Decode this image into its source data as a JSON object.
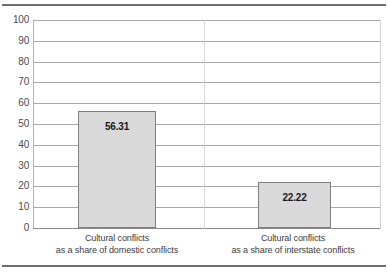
{
  "chart_data": {
    "type": "bar",
    "title": "",
    "subtitle": "",
    "xlabel": "",
    "ylabel": "",
    "ylim": [
      0,
      100
    ],
    "grid": true,
    "legend": "none",
    "orientation": "vertical",
    "categories": [
      "Cultural conflicts as a share of domestic conflicts",
      "Cultural conflicts as a share of interstate conflicts"
    ],
    "category_lines": [
      [
        "Cultural conflicts",
        "as a share of domestic conflicts"
      ],
      [
        "Cultural conflicts",
        "as a share of interstate conflicts"
      ]
    ],
    "values": [
      56.31,
      22.22
    ],
    "value_labels": [
      "56.31",
      "22.22"
    ],
    "yticks": [
      100,
      90,
      80,
      70,
      60,
      50,
      40,
      30,
      20,
      10,
      0
    ],
    "ytick_labels": [
      "100",
      "90",
      "80",
      "70",
      "60",
      "50",
      "40",
      "30",
      "20",
      "10",
      "0"
    ],
    "colors": {
      "bar_fill": "#d9d9d9",
      "bar_border": "#7e7e7e",
      "gridline": "#a8a8a8",
      "axis_line": "#b5b5b5",
      "rule": "#6e6e6e",
      "value_text": "#1a1a1a",
      "tick_text": "#4c4c4c",
      "category_text": "#3d3d3d",
      "background": "#ffffff"
    }
  }
}
